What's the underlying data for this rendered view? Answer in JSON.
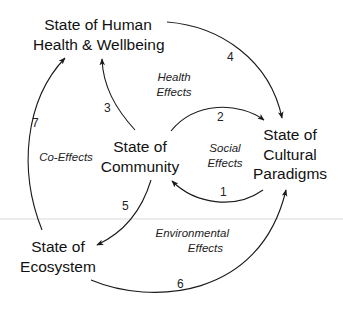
{
  "diagram": {
    "nodes": [
      {
        "id": "health",
        "lines": [
          "State of Human",
          "Health & Wellbeing"
        ]
      },
      {
        "id": "community",
        "lines": [
          "State of",
          "Community"
        ]
      },
      {
        "id": "cultural",
        "lines": [
          "State of",
          "Cultural",
          "Paradigms"
        ]
      },
      {
        "id": "ecosystem",
        "lines": [
          "State of",
          "Ecosystem"
        ]
      }
    ],
    "edge_group_labels": [
      {
        "id": "health_effects",
        "lines": [
          "Health",
          "Effects"
        ]
      },
      {
        "id": "social_effects",
        "lines": [
          "Social",
          "Effects"
        ]
      },
      {
        "id": "co_effects",
        "lines": [
          "Co-Effects"
        ]
      },
      {
        "id": "environmental_effects",
        "lines": [
          "Environmental",
          "Effects"
        ]
      }
    ],
    "edges": [
      {
        "number": "1",
        "from": "cultural",
        "to": "community"
      },
      {
        "number": "2",
        "from": "community",
        "to": "cultural"
      },
      {
        "number": "3",
        "from": "community",
        "to": "health"
      },
      {
        "number": "4",
        "from": "health",
        "to": "cultural"
      },
      {
        "number": "5",
        "from": "community",
        "to": "ecosystem"
      },
      {
        "number": "6",
        "from": "ecosystem",
        "to": "cultural"
      },
      {
        "number": "7",
        "from": "ecosystem",
        "to": "health"
      }
    ],
    "colors": {
      "line": "#1a1a1a",
      "divider": "#d0d0d0",
      "background": "#ffffff"
    }
  }
}
